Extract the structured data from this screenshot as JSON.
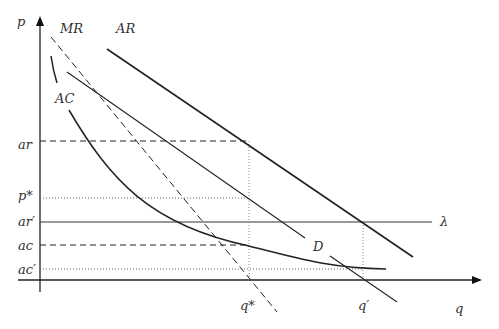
{
  "diagram": {
    "type": "economics-cost-revenue-diagram",
    "axes": {
      "y_label": "p",
      "x_label": "q"
    },
    "curve_labels": {
      "mr": "MR",
      "ar": "AR",
      "ac": "AC",
      "d": "D",
      "lambda": "λ"
    },
    "y_tick_labels": {
      "ar": "ar",
      "p_star": "p*",
      "ar_prime": "ar′",
      "ac": "ac",
      "ac_prime": "ac′"
    },
    "x_tick_labels": {
      "q_star": "q*",
      "q_prime": "q′"
    },
    "colors": {
      "line": "#222222",
      "guide": "#888888",
      "background": "#ffffff"
    }
  }
}
